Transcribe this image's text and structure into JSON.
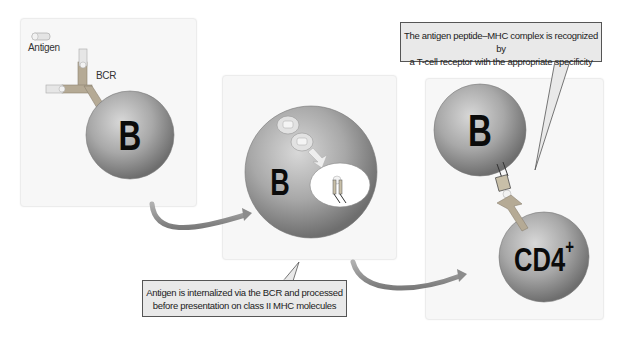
{
  "diagram": {
    "panel1": {
      "legend_label": "Antigen",
      "receptor_label": "BCR",
      "cell_label": "B"
    },
    "panel2": {
      "cell_label": "B"
    },
    "panel3": {
      "b_cell_label": "B",
      "t_cell_label": "CD4",
      "t_cell_superscript": "+"
    },
    "callouts": {
      "internalization_line1": "Antigen is internalized via the BCR and processed",
      "internalization_line2": "before presentation on class II MHC molecules",
      "recognition_line1": "The antigen peptide–MHC complex is recognized by",
      "recognition_line2": "a T-cell receptor with the appropriate specificity"
    },
    "colors": {
      "cell_gray": "#9a9a9a",
      "panel_bg": "#f7f7f7",
      "callout_bg": "#e9e9e9",
      "arrow_gray": "#8c8c8c",
      "receptor_tan": "#b5aa95"
    }
  }
}
